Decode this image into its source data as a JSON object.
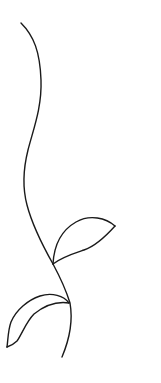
{
  "illustration": {
    "subject": "line drawing of a plant sprig with one stem and two leaves",
    "background_color": "#ffffff",
    "stroke_color": "#1a1a1a",
    "stroke_width": 1.4,
    "stem": {
      "label": "stem",
      "path": "M21,23 C34,36 40,52 41,80 C42,108 33,130 28,150 C23,170 23,190 27,205 C33,228 44,248 53,264 C60,277 66,290 70,303 C73,320 70,338 62,357"
    },
    "leaves": [
      {
        "label": "upper leaf",
        "upper_edge": "M53,264 C54,245 62,230 76,222 C90,214 106,218 115,226",
        "lower_edge": "M53,264 C62,257 72,254 84,250 C96,246 106,236 115,226"
      },
      {
        "label": "lower leaf",
        "upper_edge": "M69,303 C64,296 52,292 40,296 C28,300 16,310 11,322 C8,330 8,340 7,347",
        "lower_edge": "M69,303 C56,301 44,306 34,314 C26,322 22,334 17,341 C14,344 10,346 7,347"
      }
    ]
  }
}
